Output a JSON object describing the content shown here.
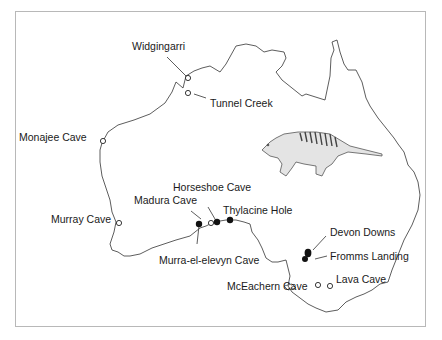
{
  "map": {
    "title": "Fossil and subfossil thylacine sites in Australia",
    "illustration": "thylacine",
    "sites": [
      {
        "name": "Widgingarri",
        "marker": "open"
      },
      {
        "name": "Tunnel Creek",
        "marker": "open"
      },
      {
        "name": "Monajee Cave",
        "marker": "open"
      },
      {
        "name": "Murray Cave",
        "marker": "open"
      },
      {
        "name": "Madura Cave",
        "marker": "open"
      },
      {
        "name": "Horseshoe Cave",
        "marker": "filled"
      },
      {
        "name": "Thylacine Hole",
        "marker": "filled"
      },
      {
        "name": "Murra-el-elevyn Cave",
        "marker": "filled"
      },
      {
        "name": "Devon Downs",
        "marker": "filled"
      },
      {
        "name": "Fromms Landing",
        "marker": "filled"
      },
      {
        "name": "Lava Cave",
        "marker": "open"
      },
      {
        "name": "McEachern Cave",
        "marker": "open"
      }
    ]
  }
}
